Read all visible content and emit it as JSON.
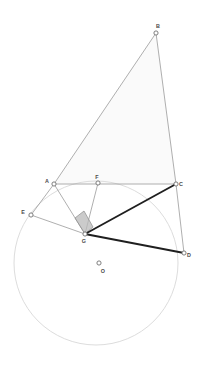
{
  "figure": {
    "canvas": {
      "width": 207,
      "height": 371,
      "background": "#ffffff"
    },
    "colors": {
      "thin_stroke": "#9a9a9a",
      "thick_stroke": "#1f1f1f",
      "circle_stroke": "#d8d8d8",
      "triangle_fill": "#fafafa",
      "angle_fill": "#b9b9b9",
      "angle_stroke": "#8c8c8c",
      "point_stroke": "#707070",
      "point_fill": "#ffffff",
      "label_color": "#4a4a4a"
    },
    "points": [
      {
        "id": "A",
        "label": "A",
        "x": 54,
        "y": 184,
        "label_dx": -7,
        "label_dy": -1,
        "marker": "circle"
      },
      {
        "id": "B",
        "label": "B",
        "x": 156,
        "y": 33,
        "label_dx": 2,
        "label_dy": -5,
        "marker": "circle"
      },
      {
        "id": "C",
        "label": "C",
        "x": 176,
        "y": 184,
        "label_dx": 5,
        "label_dy": 2,
        "marker": "circle"
      },
      {
        "id": "D",
        "label": "D",
        "x": 184,
        "y": 253,
        "label_dx": 5,
        "label_dy": 4,
        "marker": "circle"
      },
      {
        "id": "E",
        "label": "E",
        "x": 31,
        "y": 215,
        "label_dx": -8,
        "label_dy": -1,
        "marker": "circle"
      },
      {
        "id": "F",
        "label": "F",
        "x": 98,
        "y": 183,
        "label_dx": -1,
        "label_dy": -4,
        "marker": "circle"
      },
      {
        "id": "G",
        "label": "G",
        "x": 85,
        "y": 234,
        "label_dx": -1,
        "label_dy": 9,
        "marker": "circle"
      },
      {
        "id": "O",
        "label": "O",
        "x": 99,
        "y": 263,
        "label_dx": 4,
        "label_dy": 10,
        "marker": "circle"
      }
    ],
    "circle": {
      "name": "circumscribed-circle",
      "cx": 96,
      "cy": 263,
      "r": 82
    },
    "triangle_fill": {
      "name": "triangle-abc-fill",
      "vertices": "A,B,C",
      "path": "54,184 156,33 176,184"
    },
    "segments": [
      {
        "id": "AB",
        "from": "A",
        "to": "B",
        "x1": 54,
        "y1": 184,
        "x2": 156,
        "y2": 33,
        "weight": "thin"
      },
      {
        "id": "BC",
        "from": "B",
        "to": "C",
        "x1": 156,
        "y1": 33,
        "x2": 176,
        "y2": 184,
        "weight": "thin"
      },
      {
        "id": "AC",
        "from": "A",
        "to": "C",
        "x1": 54,
        "y1": 184,
        "x2": 176,
        "y2": 184,
        "weight": "thin"
      },
      {
        "id": "AE",
        "from": "A",
        "to": "E",
        "x1": 54,
        "y1": 184,
        "x2": 31,
        "y2": 215,
        "weight": "thin"
      },
      {
        "id": "EG",
        "from": "E",
        "to": "G",
        "x1": 31,
        "y1": 215,
        "x2": 85,
        "y2": 234,
        "weight": "thin"
      },
      {
        "id": "AG",
        "from": "A",
        "to": "G",
        "x1": 54,
        "y1": 184,
        "x2": 85,
        "y2": 234,
        "weight": "thin"
      },
      {
        "id": "FG",
        "from": "F",
        "to": "G",
        "x1": 98,
        "y1": 183,
        "x2": 85,
        "y2": 234,
        "weight": "thin"
      },
      {
        "id": "CD",
        "from": "C",
        "to": "D",
        "x1": 176,
        "y1": 184,
        "x2": 184,
        "y2": 253,
        "weight": "thin"
      },
      {
        "id": "GC",
        "from": "G",
        "to": "C",
        "x1": 85,
        "y1": 234,
        "x2": 176,
        "y2": 184,
        "weight": "thick"
      },
      {
        "id": "GD",
        "from": "G",
        "to": "D",
        "x1": 85,
        "y1": 234,
        "x2": 184,
        "y2": 253,
        "weight": "thick"
      }
    ],
    "right_angle": {
      "name": "right-angle-marker-at-G",
      "at": "G",
      "between": "AG,FG",
      "path": "85,234 75,218 84,211 93,227"
    }
  }
}
